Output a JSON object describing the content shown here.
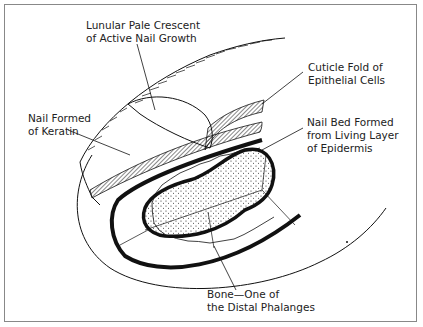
{
  "diagram": {
    "labels": {
      "lunula": [
        "Lunular Pale Crescent",
        "of Active Nail Growth"
      ],
      "cuticle": [
        "Cuticle Fold of",
        "Epithelial Cells"
      ],
      "nail": [
        "Nail Formed",
        "of Keratin"
      ],
      "nail_bed": [
        "Nail Bed Formed",
        "from Living Layer",
        "of Epidermis"
      ],
      "bone": [
        "Bone—One of",
        "the Distal Phalanges"
      ]
    },
    "colors": {
      "ink": "#111111",
      "frame": "#888888",
      "background": "#ffffff"
    }
  }
}
